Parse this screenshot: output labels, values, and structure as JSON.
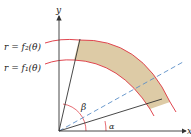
{
  "diagram": {
    "type": "polar-region",
    "axes": {
      "x_label": "x",
      "y_label": "y"
    },
    "curves": [
      {
        "name": "outer",
        "label": "r = f₂(θ)"
      },
      {
        "name": "inner",
        "label": "r = f₁(θ)"
      }
    ],
    "angles": {
      "alpha": "α",
      "beta": "β"
    },
    "colors": {
      "region_fill": "#ddcba6",
      "curve": "#e0464f",
      "axis": "#333333",
      "ray": "#333333",
      "dashed_ray": "#5b8fc7"
    }
  }
}
